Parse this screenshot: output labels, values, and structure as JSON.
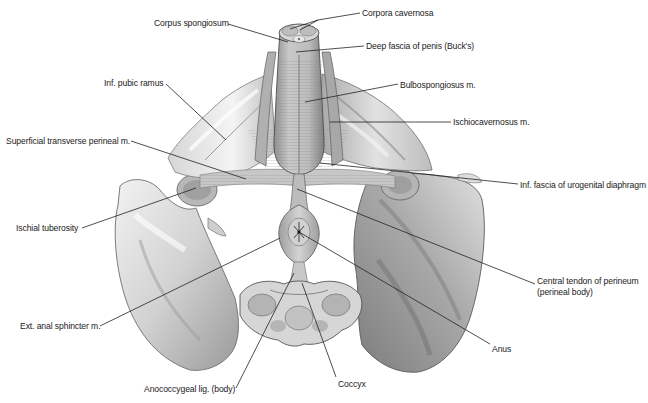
{
  "figure": {
    "background": "#ffffff",
    "colors": {
      "bone_light": "#e9e9e9",
      "bone_mid": "#c4c4c4",
      "bone_dark": "#8a8a8a",
      "muscle": "#b9b9b9",
      "muscle_dark": "#7d7d7d",
      "leader_line": "#222222",
      "label_text": "#1a1a1a"
    }
  },
  "labels": [
    {
      "id": "corpora-cavernosa",
      "text": "Corpora cavernosa",
      "x": 362,
      "y": 8,
      "line": [
        [
          360,
          13
        ],
        [
          318,
          20
        ],
        [
          300,
          32
        ]
      ],
      "line2": [
        [
          318,
          20
        ],
        [
          292,
          30
        ]
      ]
    },
    {
      "id": "corpus-spongiosum",
      "text": "Corpus spongiosum",
      "x": 154,
      "y": 18,
      "line": [
        [
          228,
          24
        ],
        [
          286,
          42
        ]
      ]
    },
    {
      "id": "deep-fascia-of-penis",
      "text": "Deep fascia of penis (Buck's)",
      "x": 366,
      "y": 41,
      "line": [
        [
          364,
          46
        ],
        [
          295,
          52
        ]
      ]
    },
    {
      "id": "inf-pubic-ramus",
      "text": "Inf. pubic ramus",
      "x": 104,
      "y": 77,
      "line": [
        [
          166,
          85
        ],
        [
          226,
          140
        ]
      ]
    },
    {
      "id": "bulbospongiosus",
      "text": "Bulbospongiosus m.",
      "x": 400,
      "y": 80,
      "line": [
        [
          398,
          84
        ],
        [
          305,
          102
        ]
      ]
    },
    {
      "id": "ischiocavernosus",
      "text": "Ischiocavernosus m.",
      "x": 453,
      "y": 117,
      "line": [
        [
          451,
          122
        ],
        [
          330,
          122
        ]
      ]
    },
    {
      "id": "superficial-transverse-perineal",
      "text": "Superficial transverse perineal m.",
      "x": 6,
      "y": 137,
      "line": [
        [
          131,
          141
        ],
        [
          245,
          178
        ]
      ]
    },
    {
      "id": "inf-fascia-urogenital",
      "text": "Inf. fascia of urogenital diaphragm",
      "x": 520,
      "y": 181,
      "line": [
        [
          518,
          184
        ],
        [
          320,
          162
        ]
      ]
    },
    {
      "id": "ischial-tuberosity",
      "text": "Ischial tuberosity",
      "x": 16,
      "y": 223,
      "line": [
        [
          82,
          228
        ],
        [
          196,
          188
        ]
      ]
    },
    {
      "id": "central-tendon",
      "text": "Central tendon of perineum",
      "x": 537,
      "y": 276,
      "line": [
        [
          535,
          285
        ],
        [
          296,
          188
        ]
      ]
    },
    {
      "id": "central-tendon-2",
      "text": "(perineal body)",
      "x": 537,
      "y": 287
    },
    {
      "id": "ext-anal-sphincter",
      "text": "Ext. anal sphincter m.",
      "x": 20,
      "y": 322,
      "line": [
        [
          100,
          325
        ],
        [
          280,
          238
        ]
      ]
    },
    {
      "id": "anus",
      "text": "Anus",
      "x": 492,
      "y": 345,
      "line": [
        [
          490,
          343
        ],
        [
          295,
          228
        ]
      ]
    },
    {
      "id": "anococcygeal",
      "text": "Anococcygeal lig. (body)",
      "x": 144,
      "y": 385,
      "line": [
        [
          236,
          388
        ],
        [
          294,
          272
        ]
      ]
    },
    {
      "id": "coccyx",
      "text": "Coccyx",
      "x": 338,
      "y": 381,
      "line": [
        [
          336,
          378
        ],
        [
          300,
          282
        ]
      ]
    }
  ]
}
